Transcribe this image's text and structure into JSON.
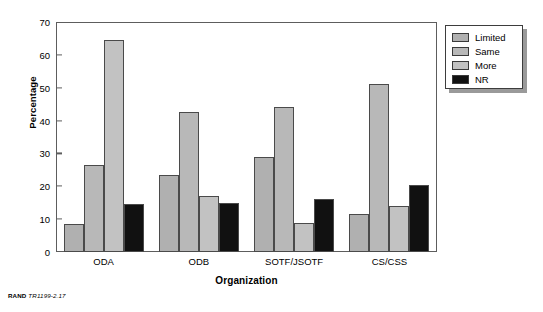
{
  "figure": {
    "footer_brand": "RAND",
    "footer_code": "TR1199-2.17"
  },
  "legend": {
    "position": "top-right",
    "items": [
      {
        "label": "Limited",
        "color": "#b0b0b0"
      },
      {
        "label": "Same",
        "color": "#b8b8b8"
      },
      {
        "label": "More",
        "color": "#c2c2c2"
      },
      {
        "label": "NR",
        "color": "#111111"
      }
    ]
  },
  "chart_data": {
    "type": "bar",
    "title": "",
    "xlabel": "Organization",
    "ylabel": "Percentage",
    "categories": [
      "ODA",
      "ODB",
      "SOTF/JSOTF",
      "CS/CSS"
    ],
    "series": [
      {
        "name": "Limited",
        "color": "#b0b0b0",
        "values": [
          8.5,
          23.5,
          29.0,
          11.5
        ]
      },
      {
        "name": "Same",
        "color": "#b8b8b8",
        "values": [
          26.5,
          42.5,
          44.0,
          51.0
        ]
      },
      {
        "name": "More",
        "color": "#c2c2c2",
        "values": [
          64.5,
          17.0,
          8.8,
          14.0
        ]
      },
      {
        "name": "NR",
        "color": "#111111",
        "values": [
          14.5,
          15.0,
          16.0,
          20.5
        ]
      }
    ],
    "ylim": [
      0,
      70
    ],
    "yticks": [
      0,
      10,
      20,
      30,
      40,
      50,
      60,
      70
    ],
    "ytick_labels": [
      "0",
      "10",
      "20",
      "30",
      "40",
      "50",
      "60",
      "70"
    ],
    "grid": false,
    "legend_position": "top-right"
  }
}
